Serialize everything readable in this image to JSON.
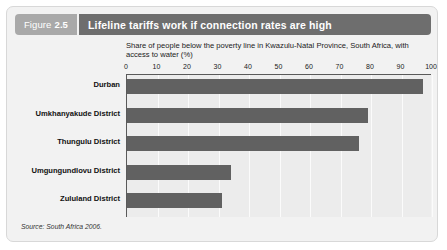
{
  "figure": {
    "label_word": "Figure",
    "number": "2.5",
    "title": "Lifeline tariffs work if connection rates are high",
    "source": "Source: South Africa 2006."
  },
  "colors": {
    "header_band": "#6e6e6e",
    "figure_tab": "#a9a9a9",
    "bar": "#616161",
    "card_background": "#f2f2f2",
    "plot_background": "#ececec",
    "axis_line": "#5a5a5a",
    "gridline": "#fbfbfb"
  },
  "chart_data": {
    "type": "bar",
    "orientation": "horizontal",
    "title": "Share of people below the poverty line in Kwazulu-Natal Province, South Africa, with access to water (%)",
    "xlabel": "",
    "ylabel": "",
    "categories": [
      "Durban",
      "Umkhanyakude District",
      "Thungulu District",
      "Umgungundlovu District",
      "Zululand District"
    ],
    "values": [
      97,
      79,
      76,
      34,
      31
    ],
    "xlim": [
      0,
      100
    ],
    "xticks": [
      0,
      10,
      20,
      30,
      40,
      50,
      60,
      70,
      80,
      90,
      100
    ],
    "xticklabels": [
      "0",
      "10",
      "20",
      "30",
      "40",
      "50",
      "60",
      "70",
      "80",
      "90",
      "100"
    ],
    "grid": true,
    "legend": false
  }
}
